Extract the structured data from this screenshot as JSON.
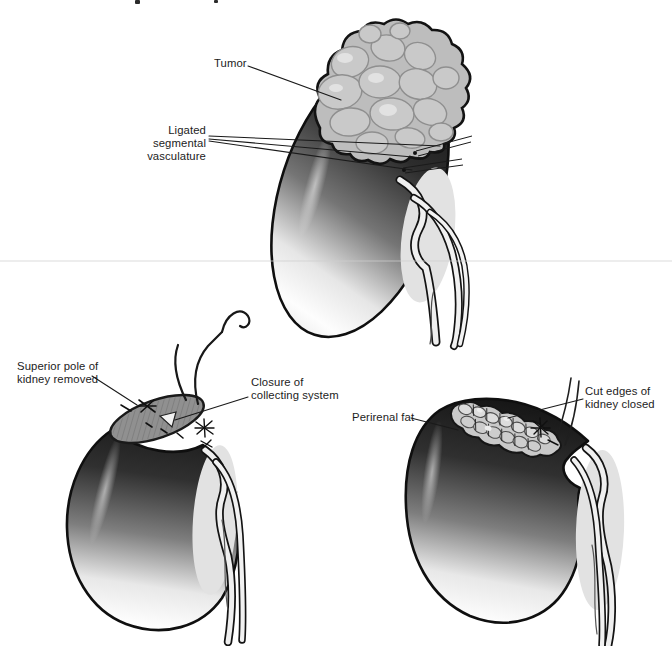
{
  "page": {
    "background": "#ffffff"
  },
  "palette": {
    "ink": "#1a1a1a",
    "label_text": "#1c1c1c",
    "kidney_dark": "#161616",
    "kidney_mid": "#7a7a7a",
    "kidney_light": "#fbfbfb",
    "tumor_fill": "#bdbdbd",
    "lobule_stroke": "#8f8f8f",
    "cut_surface": "#909090",
    "fat_fill": "#c9c9c9",
    "vessel_fill": "#efefef",
    "hilum_shadow": "#e2e2e2",
    "artifact_line": "#cfcfcf"
  },
  "figures": [
    {
      "id": "kidney-with-tumor",
      "labels": [
        {
          "text": "Tumor"
        },
        {
          "text": "Ligated segmental\nvasculature"
        }
      ]
    },
    {
      "id": "superior-pole-removed",
      "labels": [
        {
          "text": "Superior pole of\nkidney removed"
        },
        {
          "text": "Closure of\ncollecting system"
        }
      ]
    },
    {
      "id": "kidney-closed-with-fat",
      "labels": [
        {
          "text": "Perirenal fat"
        },
        {
          "text": "Cut edges of\nkidney closed"
        }
      ]
    }
  ]
}
